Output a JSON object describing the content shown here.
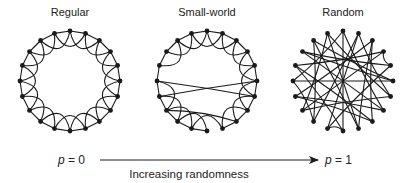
{
  "panels": [
    {
      "id": "regular",
      "title": "Regular",
      "cx": 70,
      "cy": 81,
      "r": 50,
      "nodes": 20
    },
    {
      "id": "small-world",
      "title": "Small-world",
      "cx": 207,
      "cy": 81,
      "r": 50,
      "nodes": 20
    },
    {
      "id": "random",
      "title": "Random",
      "cx": 343,
      "cy": 81,
      "r": 50,
      "nodes": 20
    }
  ],
  "axis": {
    "start_label_var": "p",
    "start_label_value": " = 0",
    "end_label_var": "p",
    "end_label_value": " = 1",
    "caption": "Increasing randomness"
  },
  "colors": {
    "ink": "#1a1a1a",
    "background": "#ffffff"
  }
}
